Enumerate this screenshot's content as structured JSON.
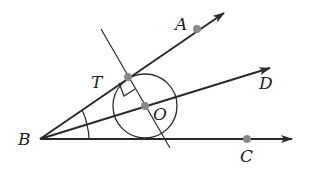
{
  "diagram": {
    "title": "",
    "colors": {
      "stroke": "#2a2a2a",
      "point": "#8a8a8a",
      "label": "#1e1e1e",
      "background": "#ffffff"
    },
    "points": [
      {
        "name": "B",
        "x": 40,
        "y": 139,
        "marked": false
      },
      {
        "name": "A",
        "x": 197,
        "y": 29,
        "marked": true
      },
      {
        "name": "T",
        "x": 128,
        "y": 77,
        "marked": true
      },
      {
        "name": "O",
        "x": 145,
        "y": 106,
        "marked": true
      },
      {
        "name": "D",
        "x": 262,
        "y": 71,
        "marked": false
      },
      {
        "name": "C",
        "x": 247,
        "y": 139,
        "marked": true
      }
    ],
    "rays": [
      {
        "name": "ray-BA",
        "from": "B",
        "through": "A",
        "end": [
          224,
          13
        ]
      },
      {
        "name": "ray-BD",
        "from": "B",
        "through": "D",
        "end": [
          270,
          68
        ]
      },
      {
        "name": "ray-BC",
        "from": "B",
        "through": "C",
        "end": [
          292,
          139
        ]
      }
    ],
    "lines": [
      {
        "name": "perpendicular-line-TO",
        "from": [
          101,
          29
        ],
        "to": [
          170,
          148
        ]
      }
    ],
    "circle": {
      "center": "O",
      "cx": 145,
      "cy": 106,
      "r": 32
    },
    "labels": {
      "A": "A",
      "T": "T",
      "O": "O",
      "D": "D",
      "B": "B",
      "C": "C"
    },
    "marks": {
      "right_angle_at": "T",
      "congruent_angle_arcs": [
        "angle-ABD",
        "angle-DBC"
      ]
    }
  }
}
